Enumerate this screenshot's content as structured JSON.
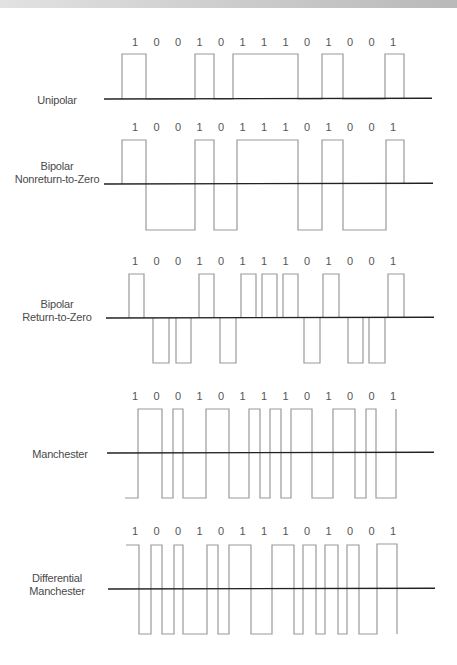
{
  "bits": [
    "1",
    "0",
    "0",
    "1",
    "0",
    "1",
    "1",
    "1",
    "0",
    "1",
    "0",
    "0",
    "1"
  ],
  "layout": {
    "cell_start": 127,
    "cell_width": 21.6,
    "label_start": 135,
    "label_step": 21.5
  },
  "colors": {
    "baseline": "#222222",
    "waveform": "#999999",
    "text": "#4a4a4a",
    "top_bar_left": "#e2e2e2",
    "top_bar_right": "#b9b9b9"
  },
  "rows": [
    {
      "id": "unipolar",
      "label_lines": [
        "Unipolar"
      ],
      "label_x": 57,
      "label_y": 94,
      "bits_y": 46,
      "baseline_y": 99,
      "baseline_x1": 104,
      "baseline_x2": 432,
      "high_y": 54,
      "low_y": 99,
      "path": [
        [
          122,
          99
        ],
        [
          122,
          54
        ],
        [
          146,
          54
        ],
        [
          146,
          99
        ],
        [
          195,
          99
        ],
        [
          195,
          54
        ],
        [
          214,
          54
        ],
        [
          214,
          99
        ],
        [
          233,
          99
        ],
        [
          233,
          54
        ],
        [
          298,
          54
        ],
        [
          298,
          99
        ],
        [
          322,
          99
        ],
        [
          322,
          54
        ],
        [
          343,
          54
        ],
        [
          343,
          99
        ],
        [
          385,
          99
        ],
        [
          385,
          54
        ],
        [
          404,
          54
        ],
        [
          404,
          99
        ]
      ]
    },
    {
      "id": "bipolar-nrz",
      "label_lines": [
        "Bipolar",
        "Nonreturn-to-Zero"
      ],
      "label_x": 57,
      "label_y": 166,
      "bits_y": 131,
      "baseline_y": 184,
      "baseline_x1": 104,
      "baseline_x2": 433,
      "high_y": 140,
      "low_y": 230,
      "path": [
        [
          122,
          184
        ],
        [
          122,
          140
        ],
        [
          146,
          140
        ],
        [
          146,
          230
        ],
        [
          195,
          230
        ],
        [
          195,
          140
        ],
        [
          214,
          140
        ],
        [
          214,
          230
        ],
        [
          237,
          230
        ],
        [
          237,
          140
        ],
        [
          298,
          140
        ],
        [
          298,
          230
        ],
        [
          322,
          230
        ],
        [
          322,
          140
        ],
        [
          343,
          140
        ],
        [
          343,
          230
        ],
        [
          386,
          230
        ],
        [
          386,
          140
        ],
        [
          404,
          140
        ],
        [
          404,
          184
        ]
      ]
    },
    {
      "id": "bipolar-rz",
      "label_lines": [
        "Bipolar",
        "Return-to-Zero"
      ],
      "label_x": 57,
      "label_y": 304,
      "bits_y": 265,
      "baseline_y": 318,
      "baseline_x1": 106,
      "baseline_x2": 434,
      "high_y": 274,
      "low_y": 363,
      "pulses": [
        [
          129,
          144,
          "up"
        ],
        [
          153,
          169,
          "down"
        ],
        [
          176,
          191,
          "down"
        ],
        [
          199,
          214,
          "up"
        ],
        [
          220,
          236,
          "down"
        ],
        [
          241,
          256,
          "up"
        ],
        [
          262,
          277,
          "up"
        ],
        [
          283,
          298,
          "up"
        ],
        [
          304,
          320,
          "down"
        ],
        [
          323,
          339,
          "up"
        ],
        [
          348,
          363,
          "down"
        ],
        [
          369,
          385,
          "down"
        ],
        [
          388,
          404,
          "up"
        ]
      ]
    },
    {
      "id": "manchester",
      "label_lines": [
        "Manchester"
      ],
      "label_x": 60,
      "label_y": 448,
      "bits_y": 400,
      "baseline_y": 453,
      "baseline_x1": 107,
      "baseline_x2": 434,
      "high_y": 409,
      "low_y": 498,
      "path": [
        [
          125,
          498
        ],
        [
          138,
          498
        ],
        [
          138,
          409
        ],
        [
          162,
          409
        ],
        [
          162,
          498
        ],
        [
          173,
          498
        ],
        [
          173,
          409
        ],
        [
          183,
          409
        ],
        [
          183,
          498
        ],
        [
          206,
          498
        ],
        [
          206,
          409
        ],
        [
          229,
          409
        ],
        [
          229,
          498
        ],
        [
          249,
          498
        ],
        [
          249,
          409
        ],
        [
          260,
          409
        ],
        [
          260,
          498
        ],
        [
          270,
          498
        ],
        [
          270,
          409
        ],
        [
          281,
          409
        ],
        [
          281,
          498
        ],
        [
          291,
          498
        ],
        [
          291,
          409
        ],
        [
          312,
          409
        ],
        [
          312,
          498
        ],
        [
          333,
          498
        ],
        [
          333,
          409
        ],
        [
          355,
          409
        ],
        [
          355,
          498
        ],
        [
          366,
          498
        ],
        [
          366,
          409
        ],
        [
          376,
          409
        ],
        [
          376,
          498
        ],
        [
          396,
          498
        ],
        [
          396,
          409
        ]
      ]
    },
    {
      "id": "differential-manchester",
      "label_lines": [
        "Differential",
        "Manchester"
      ],
      "label_x": 57,
      "label_y": 578,
      "bits_y": 535,
      "baseline_y": 589,
      "baseline_x1": 108,
      "baseline_x2": 435,
      "high_y": 545,
      "low_y": 634,
      "path": [
        [
          126,
          545
        ],
        [
          139,
          545
        ],
        [
          139,
          634
        ],
        [
          151,
          634
        ],
        [
          151,
          545
        ],
        [
          162,
          545
        ],
        [
          162,
          634
        ],
        [
          174,
          634
        ],
        [
          174,
          545
        ],
        [
          183,
          545
        ],
        [
          183,
          634
        ],
        [
          207,
          634
        ],
        [
          207,
          545
        ],
        [
          218,
          545
        ],
        [
          218,
          634
        ],
        [
          229,
          634
        ],
        [
          229,
          545
        ],
        [
          251,
          545
        ],
        [
          251,
          634
        ],
        [
          272,
          634
        ],
        [
          272,
          545
        ],
        [
          294,
          545
        ],
        [
          294,
          634
        ],
        [
          303,
          634
        ],
        [
          303,
          545
        ],
        [
          316,
          545
        ],
        [
          316,
          634
        ],
        [
          325,
          634
        ],
        [
          325,
          545
        ],
        [
          338,
          545
        ],
        [
          338,
          634
        ],
        [
          347,
          634
        ],
        [
          347,
          545
        ],
        [
          359,
          545
        ],
        [
          359,
          634
        ],
        [
          377,
          634
        ],
        [
          377,
          544
        ],
        [
          397,
          544
        ],
        [
          397,
          634
        ]
      ]
    }
  ]
}
